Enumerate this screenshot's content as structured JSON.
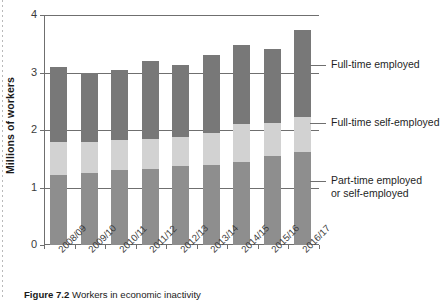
{
  "figure": {
    "caption_label": "Figure 7.2",
    "caption_text": "Workers in economic inactivity"
  },
  "chart_data": {
    "type": "bar",
    "stacked": true,
    "title": "",
    "xlabel": "",
    "ylabel": "Millions of workers",
    "ylim": [
      0,
      4
    ],
    "yticks": [
      "0",
      "1",
      "2",
      "3",
      "4"
    ],
    "grid": true,
    "legend_position": "right",
    "categories": [
      "2008/09",
      "2009/10",
      "2010/11",
      "2011/12",
      "2012/13",
      "2013/14",
      "2014/15",
      "2015/16",
      "2016/17"
    ],
    "series": [
      {
        "name": "Part-time employed or self-employed",
        "color": "#8e8e8e",
        "values": [
          1.22,
          1.25,
          1.31,
          1.32,
          1.37,
          1.4,
          1.45,
          1.55,
          1.62
        ]
      },
      {
        "name": "Full-time self-employed",
        "color": "#d2d2d2",
        "values": [
          0.57,
          0.55,
          0.52,
          0.52,
          0.5,
          0.55,
          0.65,
          0.57,
          0.6
        ]
      },
      {
        "name": "Full-time employed",
        "color": "#787878",
        "values": [
          1.31,
          1.2,
          1.22,
          1.36,
          1.26,
          1.35,
          1.37,
          1.29,
          1.52
        ]
      }
    ],
    "totals": [
      3.1,
      3.0,
      3.05,
      3.2,
      3.13,
      3.3,
      3.47,
      3.41,
      3.74
    ]
  },
  "legend": {
    "items": [
      {
        "label": "Full-time employed",
        "color": "#787878"
      },
      {
        "label": "Full-time self-employed",
        "color": "#d2d2d2"
      },
      {
        "label": "Part-time employed\nor self-employed",
        "color": "#8e8e8e"
      }
    ]
  },
  "axis": {
    "y_title": "Millions of workers"
  },
  "colors": {
    "axis": "#6f6f6f",
    "text": "#1f1f1f",
    "background": "#ffffff"
  }
}
